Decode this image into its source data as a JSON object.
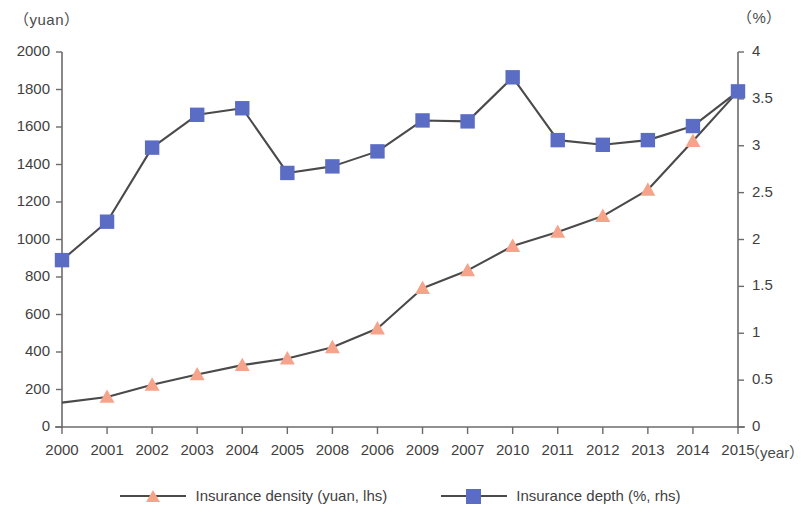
{
  "axes": {
    "left_unit": "（yuan）",
    "right_unit": "（%）",
    "x_unit": "（year）",
    "left_ticks": [
      "0",
      "200",
      "400",
      "600",
      "800",
      "1000",
      "1200",
      "1400",
      "1600",
      "1800",
      "2000"
    ],
    "right_ticks": [
      "0",
      "0.5",
      "1",
      "1.5",
      "2",
      "2.5",
      "3",
      "3.5",
      "4"
    ],
    "x_labels": [
      "2000",
      "2001",
      "2002",
      "2003",
      "2004",
      "2005",
      "2008",
      "2006",
      "2009",
      "2007",
      "2010",
      "2011",
      "2012",
      "2013",
      "2014",
      "2015"
    ]
  },
  "legend": {
    "items": [
      {
        "label": "Insurance density (yuan, lhs)",
        "marker": "triangle",
        "color": "#f5a48b"
      },
      {
        "label": "Insurance depth (%, rhs)",
        "marker": "square",
        "color": "#5b6cc4"
      }
    ]
  },
  "colors": {
    "density": "#f5a48b",
    "depth": "#5b6cc4",
    "line": "#4a4a4a",
    "axis": "#6b6b6b"
  },
  "chart_data": {
    "type": "line",
    "title": "",
    "xlabel": "（year）",
    "ylabel": "（yuan）",
    "y2label": "（%）",
    "ylim": [
      0,
      2000
    ],
    "y2lim": [
      0,
      4
    ],
    "grid": false,
    "legend_position": "bottom",
    "categories": [
      "2000",
      "2001",
      "2002",
      "2003",
      "2004",
      "2005",
      "2008",
      "2006",
      "2009",
      "2007",
      "2010",
      "2011",
      "2012",
      "2013",
      "2014",
      "2015"
    ],
    "series": [
      {
        "name": "Insurance density (yuan, lhs)",
        "axis": "left",
        "marker": "triangle",
        "color": "#f5a48b",
        "values": [
          130,
          160,
          225,
          280,
          330,
          365,
          425,
          525,
          740,
          835,
          965,
          1040,
          1125,
          1265,
          1525,
          1790
        ]
      },
      {
        "name": "Insurance depth (%, rhs)",
        "axis": "right",
        "marker": "square",
        "color": "#5b6cc4",
        "values": [
          1.78,
          2.19,
          2.98,
          3.33,
          3.4,
          2.71,
          2.78,
          2.94,
          3.27,
          3.26,
          3.73,
          3.06,
          3.01,
          3.06,
          3.21,
          3.58
        ]
      }
    ]
  }
}
